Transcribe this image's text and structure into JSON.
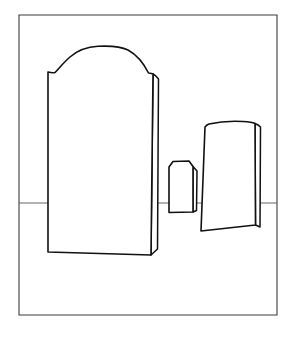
{
  "image": {
    "title": "Three Standing Stones",
    "medium": "black ink line drawing",
    "background_color": "#ffffff",
    "width": 292,
    "height": 340
  },
  "frame": {
    "name": "picture-border",
    "stroke_color": "#3a3a3a",
    "x": 19,
    "y": 15,
    "width": 258,
    "height": 300
  },
  "horizon": {
    "name": "ground-line",
    "stroke_color": "#565656",
    "y": 203,
    "x_start": 19,
    "x_end": 277
  },
  "objects": [
    {
      "id": "large-arched-stone",
      "label": "Large arched headstone",
      "position": "left",
      "top_shape": "round arch with shoulders",
      "stroke_color": "#111111",
      "fill_color": "#ffffff",
      "bbox": {
        "x": 44,
        "y": 46,
        "width": 115,
        "height": 211
      },
      "apex": {
        "x": 98,
        "y": 46
      },
      "has_side_face": true,
      "side_face_position": "right",
      "baseline_y": 253
    },
    {
      "id": "small-chamfered-stone",
      "label": "Small chamfered marker",
      "position": "center",
      "top_shape": "flat top with cut corners",
      "stroke_color": "#111111",
      "fill_color": "#ffffff",
      "bbox": {
        "x": 167,
        "y": 160,
        "width": 30,
        "height": 53
      },
      "has_side_face": true,
      "side_face_position": "right",
      "baseline_y": 213
    },
    {
      "id": "tilted-block-stone",
      "label": "Tilted rectangular stone",
      "position": "right",
      "top_shape": "slightly curved flat top",
      "stroke_color": "#111111",
      "fill_color": "#ffffff",
      "bbox": {
        "x": 199,
        "y": 121,
        "width": 62,
        "height": 112
      },
      "has_side_face": true,
      "side_face_position": "right",
      "baseline_y": 232,
      "tilt": "leaning left"
    }
  ],
  "geometry": {
    "frame_path": "M19,15 L277,15 L277,315 L19,315 Z",
    "horizon_path": "M19,203 L277,203",
    "large_stone_front": "M48,72 L48,252 L151,255 L153,74 C153,74 150,73 148.5,73 C146,68 139,56 128,50 C119,45.5 108,45.8 98,46.3 C88,46.8 78,50 70,57 C63.5,62.6 58,69.5 55,72.5 C53,73 50,72.5 48,72 Z",
    "large_stone_side": "M153,74 C155,75 157,77 158.5,79 L157.5,249 L151,255 L153,74 Z",
    "small_stone_front": "M169,167 L173,161.5 L189,161 L193,166.5 L193,212 L169,212.5 Z",
    "small_stone_side": "M193,166.5 L197,171 L196.5,210.5 L193,212 Z",
    "right_stone_front": "M201,231 L205,127 C205,127 207,124.5 209,124 C220,121.5 234,121 243,121.5 C249,121.8 253,122.5 255,123.5 L255.5,225 L201,231 Z",
    "right_stone_side": "M255,123.5 C257.5,124.5 259.5,126 260.5,127 L260,227 L255.5,225 L255,123.5 Z"
  }
}
